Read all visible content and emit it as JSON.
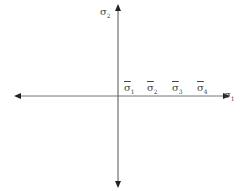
{
  "diagram": {
    "type": "stress-axes",
    "vertical_axis_label": {
      "symbol": "σ",
      "subscript": "2"
    },
    "horizontal_axis_label": {
      "symbol": "σ",
      "subscript": "1"
    },
    "marks": [
      {
        "symbol": "σ",
        "subscript": "1",
        "overbar": true
      },
      {
        "symbol": "σ",
        "subscript": "2",
        "overbar": true
      },
      {
        "symbol": "σ",
        "subscript": "3",
        "overbar": true
      },
      {
        "symbol": "σ",
        "subscript": "4",
        "overbar": true
      }
    ],
    "colors": {
      "axis": "#555555",
      "arrow": "#222222",
      "text": "#444444"
    }
  }
}
